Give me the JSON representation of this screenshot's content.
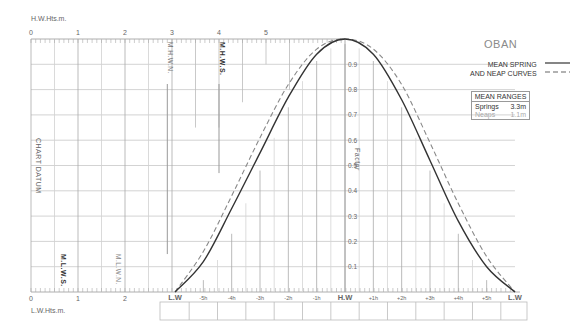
{
  "station": "OBAN",
  "legend": {
    "line1": "MEAN SPRING",
    "line2": "AND NEAP CURVES",
    "spring_style": "solid",
    "neap_style": "dashed"
  },
  "mean_ranges": {
    "header": "MEAN RANGES",
    "springs_label": "Springs",
    "springs_value": "3.3m",
    "neaps_label": "Neaps",
    "neaps_value": "1.1m"
  },
  "axes": {
    "hw_heights_label": "H.W.Hts.m.",
    "lw_heights_label": "L.W.Hts.m.",
    "hw_ticks": [
      "0",
      "1",
      "2",
      "3",
      "4",
      "5"
    ],
    "lw_ticks": [
      "0",
      "1",
      "2"
    ],
    "factor_label": "Factor",
    "factor_ticks": [
      "0.1",
      "0.2",
      "0.3",
      "0.4",
      "0.5",
      "0.6",
      "0.7",
      "0.8",
      "0.9"
    ],
    "chart_datum_label": "CHART DATUM",
    "time_ticks": [
      "L.W",
      "-5h",
      "-4h",
      "-3h",
      "-2h",
      "-1h",
      "H.W",
      "+1h",
      "+2h",
      "+3h",
      "+4h",
      "+5h",
      "L.W"
    ]
  },
  "markers": {
    "mhws": "M.H.W.S.",
    "mhwn": "M.H.W.N.",
    "mlws": "M.L.W.S.",
    "mlwn": "M.L.W.N."
  },
  "chart_data": {
    "type": "line",
    "xlabel": "Hours relative to H.W",
    "ylabel": "Factor",
    "x": [
      -6,
      -5,
      -4,
      -3,
      -2,
      -1,
      0,
      1,
      2,
      3,
      4,
      5,
      6
    ],
    "series": [
      {
        "name": "Mean Spring",
        "style": "solid",
        "values": [
          0.0,
          0.12,
          0.33,
          0.55,
          0.77,
          0.94,
          1.0,
          0.94,
          0.76,
          0.52,
          0.28,
          0.1,
          0.0
        ]
      },
      {
        "name": "Mean Neap",
        "style": "dashed",
        "values": [
          0.0,
          0.16,
          0.38,
          0.61,
          0.82,
          0.96,
          1.0,
          0.96,
          0.82,
          0.59,
          0.35,
          0.14,
          0.0
        ]
      }
    ],
    "ylim": [
      0,
      1.0
    ],
    "hw_height_axis_m": [
      0,
      5
    ],
    "lw_height_axis_m": [
      0,
      2
    ],
    "levels": {
      "MHWS": 4.0,
      "MHWN": 2.9,
      "MLWS": 0.7,
      "MLWN": 1.8
    },
    "mean_ranges": {
      "springs_m": 3.3,
      "neaps_m": 1.1
    }
  }
}
